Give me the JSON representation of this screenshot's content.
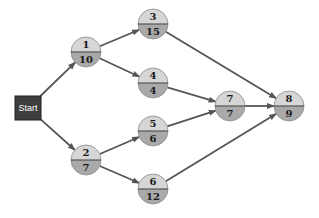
{
  "start": {
    "id": "start",
    "label": "Start"
  },
  "nodes": [
    {
      "id": "1",
      "label": "1",
      "duration": "10"
    },
    {
      "id": "2",
      "label": "2",
      "duration": "7"
    },
    {
      "id": "3",
      "label": "3",
      "duration": "15"
    },
    {
      "id": "4",
      "label": "4",
      "duration": "4"
    },
    {
      "id": "5",
      "label": "5",
      "duration": "6"
    },
    {
      "id": "6",
      "label": "6",
      "duration": "12"
    },
    {
      "id": "7",
      "label": "7",
      "duration": "7"
    },
    {
      "id": "8",
      "label": "8",
      "duration": "9"
    }
  ],
  "edges": [
    {
      "from": "start",
      "to": "1"
    },
    {
      "from": "start",
      "to": "2"
    },
    {
      "from": "1",
      "to": "3"
    },
    {
      "from": "1",
      "to": "4"
    },
    {
      "from": "2",
      "to": "5"
    },
    {
      "from": "2",
      "to": "6"
    },
    {
      "from": "3",
      "to": "8"
    },
    {
      "from": "4",
      "to": "7"
    },
    {
      "from": "5",
      "to": "7"
    },
    {
      "from": "7",
      "to": "8"
    },
    {
      "from": "6",
      "to": "8"
    }
  ],
  "colors": {
    "start_fill": "#3d3d3d",
    "node_top": "#d6d6d6",
    "node_bottom": "#a9a9a9",
    "edge": "#555555"
  }
}
